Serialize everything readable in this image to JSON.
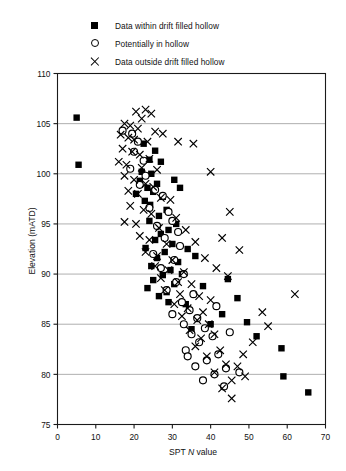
{
  "chart_data": {
    "type": "scatter",
    "title": "",
    "xlabel": "SPT N value",
    "xlabel_parts": {
      "pre": "SPT ",
      "italic": "N",
      "post": " value"
    },
    "ylabel": "Elevation (mATD)",
    "xlim": [
      0,
      70
    ],
    "ylim": [
      75,
      110
    ],
    "xticks": [
      0,
      10,
      20,
      30,
      40,
      50,
      60,
      70
    ],
    "yticks": [
      75,
      80,
      85,
      90,
      95,
      100,
      105,
      110
    ],
    "grid": "horizontal",
    "grid_color": "#9a9a9a",
    "axis_color": "#1a1a1a",
    "legend_position": "above-plot",
    "series": [
      {
        "name": "Data within drift filled hollow",
        "marker": "filled-square",
        "color": "#000000",
        "points": [
          [
            5.0,
            105.6
          ],
          [
            5.5,
            100.9
          ],
          [
            22.5,
            103.0
          ],
          [
            25.5,
            102.3
          ],
          [
            24.0,
            101.4
          ],
          [
            27.0,
            101.2
          ],
          [
            22.0,
            100.2
          ],
          [
            24.5,
            100.0
          ],
          [
            21.5,
            99.3
          ],
          [
            26.0,
            99.0
          ],
          [
            23.5,
            98.6
          ],
          [
            25.0,
            98.2
          ],
          [
            20.5,
            98.0
          ],
          [
            27.5,
            97.7
          ],
          [
            22.8,
            97.3
          ],
          [
            24.2,
            96.9
          ],
          [
            30.5,
            99.4
          ],
          [
            32.0,
            98.6
          ],
          [
            28.5,
            96.4
          ],
          [
            26.5,
            95.8
          ],
          [
            24.0,
            95.3
          ],
          [
            31.0,
            95.0
          ],
          [
            29.0,
            94.4
          ],
          [
            27.0,
            94.0
          ],
          [
            25.5,
            93.4
          ],
          [
            30.0,
            93.0
          ],
          [
            23.0,
            92.6
          ],
          [
            28.0,
            92.2
          ],
          [
            26.0,
            91.6
          ],
          [
            31.5,
            91.2
          ],
          [
            24.5,
            90.8
          ],
          [
            29.5,
            90.4
          ],
          [
            27.5,
            89.9
          ],
          [
            25.0,
            89.4
          ],
          [
            30.5,
            89.0
          ],
          [
            23.5,
            88.6
          ],
          [
            28.5,
            88.2
          ],
          [
            26.5,
            87.8
          ],
          [
            32.5,
            90.0
          ],
          [
            34.0,
            92.5
          ],
          [
            36.0,
            91.8
          ],
          [
            29.0,
            87.2
          ],
          [
            33.5,
            87.0
          ],
          [
            38.0,
            88.8
          ],
          [
            44.5,
            89.5
          ],
          [
            47.0,
            87.6
          ],
          [
            43.0,
            86.0
          ],
          [
            49.5,
            85.2
          ],
          [
            52.0,
            83.8
          ],
          [
            58.5,
            82.6
          ],
          [
            65.5,
            78.2
          ],
          [
            59.0,
            79.8
          ],
          [
            35.0,
            84.5
          ],
          [
            40.0,
            85.0
          ]
        ]
      },
      {
        "name": "Potentially in hollow",
        "marker": "open-circle",
        "color": "#000000",
        "points": [
          [
            17.0,
            104.3
          ],
          [
            19.5,
            104.0
          ],
          [
            21.0,
            103.2
          ],
          [
            20.0,
            102.2
          ],
          [
            22.5,
            101.3
          ],
          [
            19.0,
            100.5
          ],
          [
            23.0,
            99.8
          ],
          [
            21.5,
            98.9
          ],
          [
            25.5,
            98.4
          ],
          [
            27.5,
            97.8
          ],
          [
            24.0,
            96.6
          ],
          [
            29.0,
            96.2
          ],
          [
            30.0,
            95.3
          ],
          [
            26.0,
            94.8
          ],
          [
            31.5,
            94.2
          ],
          [
            28.0,
            93.6
          ],
          [
            32.0,
            92.8
          ],
          [
            25.0,
            92.0
          ],
          [
            30.5,
            91.4
          ],
          [
            27.0,
            90.6
          ],
          [
            33.0,
            90.0
          ],
          [
            31.0,
            89.2
          ],
          [
            28.5,
            88.4
          ],
          [
            35.5,
            88.0
          ],
          [
            32.5,
            87.2
          ],
          [
            34.5,
            86.4
          ],
          [
            30.0,
            86.0
          ],
          [
            36.5,
            85.6
          ],
          [
            33.0,
            85.0
          ],
          [
            38.5,
            84.6
          ],
          [
            35.0,
            84.0
          ],
          [
            40.5,
            83.8
          ],
          [
            37.0,
            83.2
          ],
          [
            33.5,
            82.4
          ],
          [
            42.0,
            82.0
          ],
          [
            39.0,
            81.4
          ],
          [
            36.0,
            80.8
          ],
          [
            44.0,
            80.6
          ],
          [
            41.0,
            80.0
          ],
          [
            47.5,
            80.2
          ],
          [
            38.0,
            79.4
          ],
          [
            34.0,
            81.8
          ],
          [
            43.5,
            78.8
          ],
          [
            45.0,
            84.2
          ],
          [
            41.5,
            86.8
          ]
        ]
      },
      {
        "name": "Data outside drift filled hollow",
        "marker": "cross",
        "color": "#000000",
        "points": [
          [
            20.5,
            106.2
          ],
          [
            23.0,
            106.4
          ],
          [
            24.5,
            106.0
          ],
          [
            22.0,
            105.5
          ],
          [
            17.5,
            105.0
          ],
          [
            19.0,
            104.8
          ],
          [
            21.0,
            104.5
          ],
          [
            25.5,
            104.2
          ],
          [
            16.5,
            103.9
          ],
          [
            18.5,
            103.6
          ],
          [
            20.0,
            103.4
          ],
          [
            23.5,
            103.2
          ],
          [
            27.5,
            104.0
          ],
          [
            31.5,
            103.2
          ],
          [
            35.5,
            103.0
          ],
          [
            17.0,
            102.5
          ],
          [
            19.5,
            102.2
          ],
          [
            21.5,
            101.9
          ],
          [
            24.0,
            101.5
          ],
          [
            16.0,
            101.2
          ],
          [
            18.0,
            100.9
          ],
          [
            22.0,
            100.6
          ],
          [
            26.0,
            100.4
          ],
          [
            40.0,
            100.2
          ],
          [
            17.5,
            99.8
          ],
          [
            20.0,
            99.4
          ],
          [
            23.0,
            99.0
          ],
          [
            25.0,
            98.7
          ],
          [
            18.5,
            98.3
          ],
          [
            21.0,
            98.0
          ],
          [
            27.0,
            97.6
          ],
          [
            29.5,
            97.4
          ],
          [
            45.0,
            96.2
          ],
          [
            19.0,
            96.8
          ],
          [
            22.5,
            96.4
          ],
          [
            24.5,
            96.0
          ],
          [
            31.0,
            95.6
          ],
          [
            17.5,
            95.2
          ],
          [
            20.5,
            95.0
          ],
          [
            26.5,
            94.6
          ],
          [
            33.5,
            94.4
          ],
          [
            21.5,
            93.8
          ],
          [
            24.0,
            93.4
          ],
          [
            28.5,
            93.0
          ],
          [
            36.0,
            93.2
          ],
          [
            43.0,
            93.6
          ],
          [
            47.5,
            92.4
          ],
          [
            23.0,
            92.2
          ],
          [
            26.0,
            91.8
          ],
          [
            30.0,
            91.4
          ],
          [
            38.5,
            91.6
          ],
          [
            25.5,
            90.8
          ],
          [
            29.0,
            90.4
          ],
          [
            33.0,
            90.2
          ],
          [
            41.5,
            90.6
          ],
          [
            27.0,
            89.6
          ],
          [
            31.5,
            89.2
          ],
          [
            35.0,
            89.0
          ],
          [
            44.5,
            89.8
          ],
          [
            28.0,
            88.4
          ],
          [
            32.0,
            88.0
          ],
          [
            37.0,
            87.8
          ],
          [
            40.0,
            87.4
          ],
          [
            30.5,
            87.0
          ],
          [
            34.0,
            86.6
          ],
          [
            38.0,
            86.2
          ],
          [
            32.5,
            85.8
          ],
          [
            36.5,
            85.4
          ],
          [
            39.5,
            85.0
          ],
          [
            34.5,
            84.4
          ],
          [
            41.0,
            84.0
          ],
          [
            37.5,
            83.6
          ],
          [
            36.0,
            82.8
          ],
          [
            42.5,
            82.4
          ],
          [
            39.0,
            81.8
          ],
          [
            44.0,
            81.0
          ],
          [
            47.0,
            80.8
          ],
          [
            41.0,
            80.2
          ],
          [
            45.5,
            79.4
          ],
          [
            43.0,
            78.6
          ],
          [
            45.5,
            77.6
          ],
          [
            48.5,
            82.0
          ],
          [
            51.0,
            83.2
          ],
          [
            49.0,
            79.8
          ],
          [
            62.0,
            88.0
          ],
          [
            55.0,
            84.8
          ],
          [
            53.5,
            86.2
          ]
        ]
      }
    ]
  },
  "legend": {
    "items": [
      {
        "marker": "filled-square",
        "label": "Data within drift filled hollow"
      },
      {
        "marker": "open-circle",
        "label": "Potentially in hollow"
      },
      {
        "marker": "cross",
        "label": "Data outside drift filled hollow"
      }
    ]
  },
  "axes": {
    "y_title": "Elevation (mATD)",
    "x_title_pre": "SPT ",
    "x_title_italic": "N",
    "x_title_post": " value"
  }
}
